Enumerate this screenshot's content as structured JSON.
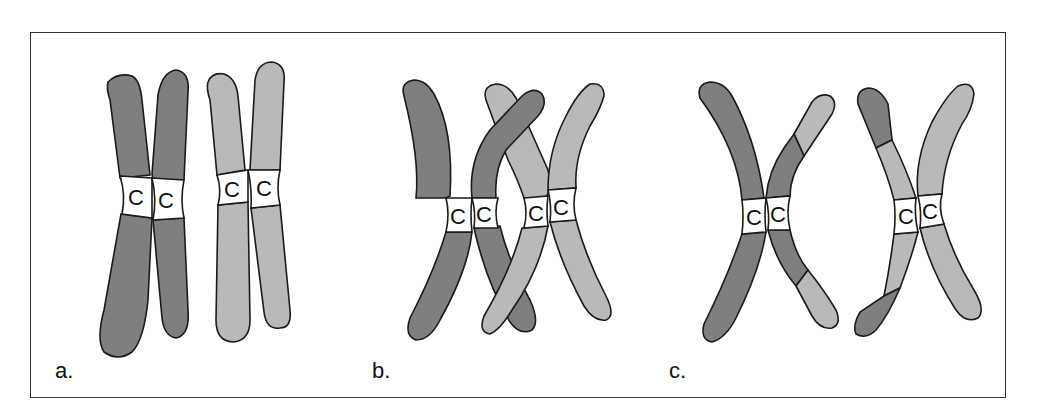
{
  "figure": {
    "colors": {
      "dark": "#7f7f7f",
      "light": "#b9b9b9",
      "centromere": "#ffffff",
      "outline": "#1a1a1a"
    },
    "centromere_label": "C",
    "panels": [
      {
        "label": "a.",
        "description": "Two pairs of sister chromatids aligned side by side (dark pair, light pair)"
      },
      {
        "label": "b.",
        "description": "Non-sister chromatids crossing over (chiasma)"
      },
      {
        "label": "c.",
        "description": "Recombinant chromatids with exchanged segments"
      }
    ]
  }
}
